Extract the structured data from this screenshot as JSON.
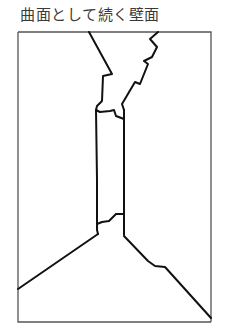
{
  "caption": "曲面として続く壁面",
  "figure": {
    "stroke_color": "#111111",
    "frame_color": "#555555"
  }
}
